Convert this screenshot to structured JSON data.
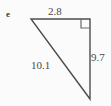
{
  "figure": {
    "part_label": "e",
    "shape": "right-triangle",
    "background_color": "#fbfbfb",
    "stroke_color": "#4d4d4d",
    "text_color": "#4a4a4a",
    "stroke_width": 1.4,
    "right_angle_marker": {
      "present": true,
      "corner": "top-right",
      "size_px": 9
    },
    "vertices": {
      "top_left": {
        "x": 31,
        "y": 19
      },
      "top_right": {
        "x": 90,
        "y": 19
      },
      "bottom_right": {
        "x": 90,
        "y": 99
      }
    },
    "sides": [
      {
        "name": "top-side",
        "label": "2.8",
        "position": "above",
        "from": "top_left",
        "to": "top_right"
      },
      {
        "name": "right-side",
        "label": "9.7",
        "position": "right",
        "from": "top_right",
        "to": "bottom_right"
      },
      {
        "name": "hypotenuse",
        "label": "10.1",
        "position": "left",
        "from": "top_left",
        "to": "bottom_right"
      }
    ]
  }
}
